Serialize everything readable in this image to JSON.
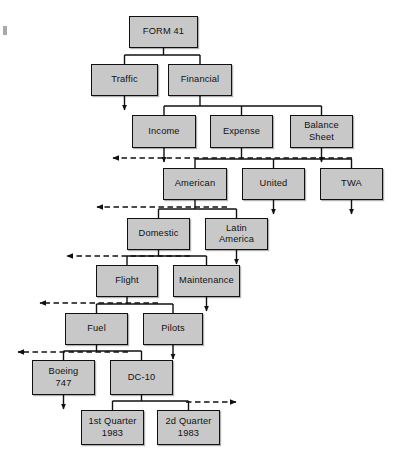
{
  "figure": {
    "kind": "hierarchy-tree-diagram",
    "page_corner_mark": "page-edge-mark"
  },
  "colors": {
    "node_fill": "#c8c8c8",
    "node_border": "#111111",
    "line": "#111111",
    "dashed_line": "#111111",
    "background": "#ffffff"
  },
  "nodes": [
    {
      "id": "form41",
      "label": "FORM 41",
      "x": 129,
      "y": 16,
      "w": 69,
      "h": 32,
      "level": 0
    },
    {
      "id": "traffic",
      "label": "Traffic",
      "x": 91,
      "y": 64,
      "w": 67,
      "h": 32,
      "level": 1
    },
    {
      "id": "financial",
      "label": "Financial",
      "x": 168,
      "y": 64,
      "w": 64,
      "h": 32,
      "level": 1
    },
    {
      "id": "income",
      "label": "Income",
      "x": 132,
      "y": 115,
      "w": 64,
      "h": 33,
      "level": 2
    },
    {
      "id": "expense",
      "label": "Expense",
      "x": 210,
      "y": 115,
      "w": 63,
      "h": 33,
      "level": 2
    },
    {
      "id": "balance",
      "label": "Balance\nSheet",
      "x": 290,
      "y": 115,
      "w": 63,
      "h": 33,
      "level": 2
    },
    {
      "id": "american",
      "label": "American",
      "x": 163,
      "y": 168,
      "w": 64,
      "h": 32,
      "level": 3
    },
    {
      "id": "united",
      "label": "United",
      "x": 242,
      "y": 168,
      "w": 63,
      "h": 32,
      "level": 3
    },
    {
      "id": "twa",
      "label": "TWA",
      "x": 320,
      "y": 168,
      "w": 63,
      "h": 32,
      "level": 3
    },
    {
      "id": "domestic",
      "label": "Domestic",
      "x": 127,
      "y": 218,
      "w": 63,
      "h": 32,
      "level": 4
    },
    {
      "id": "latin",
      "label": "Latin\nAmerica",
      "x": 205,
      "y": 218,
      "w": 63,
      "h": 32,
      "level": 4
    },
    {
      "id": "flight",
      "label": "Flight",
      "x": 96,
      "y": 265,
      "w": 62,
      "h": 32,
      "level": 5
    },
    {
      "id": "maint",
      "label": "Maintenance",
      "x": 173,
      "y": 265,
      "w": 67,
      "h": 32,
      "level": 5
    },
    {
      "id": "fuel",
      "label": "Fuel",
      "x": 65,
      "y": 313,
      "w": 63,
      "h": 32,
      "level": 6
    },
    {
      "id": "pilots",
      "label": "Pilots",
      "x": 143,
      "y": 313,
      "w": 60,
      "h": 32,
      "level": 6
    },
    {
      "id": "boeing",
      "label": "Boeing\n747",
      "x": 32,
      "y": 360,
      "w": 63,
      "h": 35,
      "level": 7
    },
    {
      "id": "dc10",
      "label": "DC-10",
      "x": 110,
      "y": 360,
      "w": 63,
      "h": 35,
      "level": 7
    },
    {
      "id": "q1",
      "label": "1st Quarter\n1983",
      "x": 81,
      "y": 410,
      "w": 63,
      "h": 35,
      "level": 8
    },
    {
      "id": "q2",
      "label": "2d Quarter\n1983",
      "x": 157,
      "y": 410,
      "w": 63,
      "h": 35,
      "level": 8
    }
  ],
  "tree_edges": [
    {
      "from": "form41",
      "to": [
        "traffic",
        "financial"
      ]
    },
    {
      "from": "financial",
      "to": [
        "income",
        "expense",
        "balance"
      ]
    },
    {
      "from": "expense",
      "to": [
        "american",
        "united",
        "twa"
      ]
    },
    {
      "from": "american",
      "to": [
        "domestic",
        "latin"
      ]
    },
    {
      "from": "domestic",
      "to": [
        "flight",
        "maint"
      ]
    },
    {
      "from": "flight",
      "to": [
        "fuel",
        "pilots"
      ]
    },
    {
      "from": "fuel",
      "to": [
        "boeing",
        "dc10"
      ]
    },
    {
      "from": "dc10",
      "to": [
        "q1",
        "q2"
      ]
    }
  ],
  "continuation_arrows": [
    {
      "id": "traffic-down",
      "from": "traffic",
      "direction": "down"
    },
    {
      "id": "income-down",
      "from": "income",
      "direction": "down"
    },
    {
      "id": "balance-down",
      "from": "balance",
      "direction": "down"
    },
    {
      "id": "united-down",
      "from": "united",
      "direction": "down"
    },
    {
      "id": "twa-down",
      "from": "twa",
      "direction": "down"
    },
    {
      "id": "latin-down",
      "from": "latin",
      "direction": "down"
    },
    {
      "id": "maint-down",
      "from": "maint",
      "direction": "down"
    },
    {
      "id": "pilots-down",
      "from": "pilots",
      "direction": "down"
    },
    {
      "id": "boeing-down",
      "from": "boeing",
      "direction": "down"
    }
  ],
  "dashed_arrows": [
    {
      "id": "dashed-level-2",
      "direction": "left",
      "y": 158,
      "x_start": 113,
      "x_end": 352
    },
    {
      "id": "dashed-level-3",
      "direction": "left",
      "y": 207,
      "x_start": 97,
      "x_end": 227
    },
    {
      "id": "dashed-level-4",
      "direction": "left",
      "y": 256,
      "x_start": 67,
      "x_end": 190
    },
    {
      "id": "dashed-level-5",
      "direction": "left",
      "y": 303,
      "x_start": 40,
      "x_end": 158
    },
    {
      "id": "dashed-level-6",
      "direction": "left",
      "y": 352,
      "x_start": 18,
      "x_end": 128
    },
    {
      "id": "dashed-level-7",
      "direction": "right",
      "y": 402,
      "x_start": 186,
      "x_end": 236
    }
  ]
}
